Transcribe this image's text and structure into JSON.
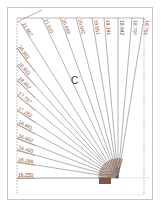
{
  "diagram": {
    "center_label": "C",
    "focal_point": {
      "x": 118,
      "y": 178
    },
    "top_labels": [
      "21.807",
      "21.510",
      "20.683",
      "20.042",
      "19.551",
      "19.191",
      "18.942",
      "18.797",
      "18.750"
    ],
    "left_labels": [
      "20.382",
      "18.933",
      "18.457",
      "17.797",
      "17.282",
      "16.891",
      "16.602",
      "16.403",
      "16.288",
      "16.250"
    ],
    "colors": {
      "lines": "#555555",
      "labels": "#8a4a2a",
      "arc": "#6b3a22",
      "frame": "#888888",
      "page_border": "#c8c8c8"
    }
  }
}
